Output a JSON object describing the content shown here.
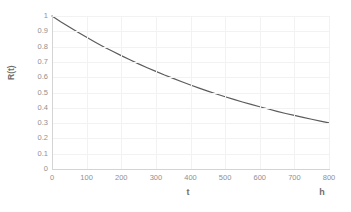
{
  "chart_data": {
    "type": "line",
    "title": "",
    "subtitle": "",
    "xlabel": "t",
    "xunit": "h",
    "ylabel": "R(t)",
    "xlim": [
      0,
      800
    ],
    "ylim": [
      0,
      1
    ],
    "grid": true,
    "legend": "none",
    "series_name": "R(t)",
    "series_color": "#5c5c5c",
    "grid_color": "#f2f2f2",
    "axis_color": "#d4d4d4",
    "tick_label_color": "#909090",
    "background": "#ffffff",
    "equation": "R(t) = exp(-0.0015 t)",
    "x_ticks": [
      "0",
      "100",
      "200",
      "300",
      "400",
      "500",
      "600",
      "700",
      "800"
    ],
    "x_tick_values": [
      0,
      100,
      200,
      300,
      400,
      500,
      600,
      700,
      800
    ],
    "y_ticks": [
      "0",
      "0.1",
      "0.2",
      "0.3",
      "0.4",
      "0.5",
      "0.6",
      "0.7",
      "0.8",
      "0.9",
      "1"
    ],
    "y_tick_values": [
      0,
      0.1,
      0.2,
      0.3,
      0.4,
      0.5,
      0.6,
      0.7,
      0.8,
      0.9,
      1
    ],
    "x": [
      0,
      25,
      50,
      75,
      100,
      125,
      150,
      175,
      200,
      225,
      250,
      275,
      300,
      325,
      350,
      375,
      400,
      425,
      450,
      475,
      500,
      525,
      550,
      575,
      600,
      625,
      650,
      675,
      700,
      725,
      750,
      775,
      800
    ],
    "values": [
      1.0,
      0.963,
      0.928,
      0.894,
      0.861,
      0.829,
      0.798,
      0.769,
      0.741,
      0.714,
      0.687,
      0.662,
      0.638,
      0.614,
      0.592,
      0.57,
      0.549,
      0.529,
      0.509,
      0.49,
      0.472,
      0.455,
      0.438,
      0.422,
      0.407,
      0.392,
      0.377,
      0.363,
      0.35,
      0.337,
      0.325,
      0.313,
      0.301
    ]
  }
}
